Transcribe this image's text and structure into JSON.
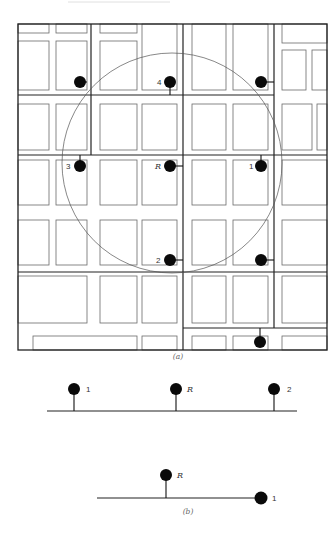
{
  "figure_a": {
    "caption": "(a)",
    "markers": [
      {
        "id": "unlabeled-nw",
        "label": ""
      },
      {
        "id": "4",
        "label": "4"
      },
      {
        "id": "unlabeled-ne",
        "label": ""
      },
      {
        "id": "3",
        "label": "3"
      },
      {
        "id": "R",
        "label": "R"
      },
      {
        "id": "1",
        "label": "1"
      },
      {
        "id": "2",
        "label": "2"
      },
      {
        "id": "unlabeled-se",
        "label": ""
      },
      {
        "id": "unlabeled-s",
        "label": ""
      }
    ]
  },
  "figure_b": {
    "caption": "(b)",
    "top_line": {
      "labels": [
        "1",
        "R",
        "2"
      ]
    },
    "bottom_line": {
      "labels": [
        "R",
        "1"
      ]
    }
  },
  "colors": {
    "ink": "#0a0a0a",
    "block_outline": "#6a6a6a",
    "background": "#ffffff"
  }
}
